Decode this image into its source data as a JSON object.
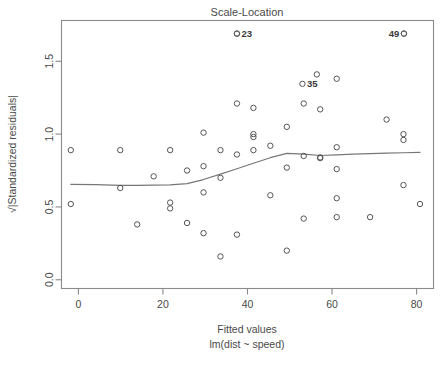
{
  "chart_data": {
    "type": "scatter",
    "title": "Scale-Location",
    "xlabel": "Fitted values",
    "xlabel_sub": "lm(dist ~ speed)",
    "ylabel": "√|Standardized residuals|",
    "xlim": [
      -4,
      84
    ],
    "ylim": [
      -0.06,
      1.78
    ],
    "xticks": [
      0,
      20,
      40,
      60,
      80
    ],
    "xtick_labels": [
      "0",
      "20",
      "40",
      "60",
      "80"
    ],
    "yticks": [
      0.0,
      0.5,
      1.0,
      1.5
    ],
    "ytick_labels": [
      "0.0",
      "0.5",
      "1.0",
      "1.5"
    ],
    "grid": false,
    "legend": null,
    "point_style": "open-circle",
    "points": [
      {
        "x": -1.8,
        "y": 0.89
      },
      {
        "x": -1.8,
        "y": 0.52
      },
      {
        "x": 9.9,
        "y": 0.89
      },
      {
        "x": 9.9,
        "y": 0.63
      },
      {
        "x": 13.9,
        "y": 0.38
      },
      {
        "x": 17.8,
        "y": 0.71
      },
      {
        "x": 21.7,
        "y": 0.89
      },
      {
        "x": 21.7,
        "y": 0.53
      },
      {
        "x": 21.7,
        "y": 0.49
      },
      {
        "x": 25.7,
        "y": 0.75
      },
      {
        "x": 25.7,
        "y": 0.39
      },
      {
        "x": 29.6,
        "y": 1.01
      },
      {
        "x": 29.6,
        "y": 0.78
      },
      {
        "x": 29.6,
        "y": 0.6
      },
      {
        "x": 29.6,
        "y": 0.32
      },
      {
        "x": 33.6,
        "y": 0.89
      },
      {
        "x": 33.6,
        "y": 0.7
      },
      {
        "x": 33.6,
        "y": 0.16
      },
      {
        "x": 37.5,
        "y": 1.21
      },
      {
        "x": 37.5,
        "y": 0.86
      },
      {
        "x": 37.5,
        "y": 0.31
      },
      {
        "x": 37.5,
        "y": 1.69
      },
      {
        "x": 41.4,
        "y": 1.18
      },
      {
        "x": 41.4,
        "y": 1.0
      },
      {
        "x": 41.4,
        "y": 0.89
      },
      {
        "x": 41.4,
        "y": 0.98
      },
      {
        "x": 45.4,
        "y": 0.92
      },
      {
        "x": 45.4,
        "y": 0.58
      },
      {
        "x": 49.3,
        "y": 1.05
      },
      {
        "x": 49.3,
        "y": 0.77
      },
      {
        "x": 49.3,
        "y": 0.2
      },
      {
        "x": 53.3,
        "y": 1.21
      },
      {
        "x": 53.3,
        "y": 0.85
      },
      {
        "x": 53.3,
        "y": 0.42
      },
      {
        "x": 56.4,
        "y": 1.41
      },
      {
        "x": 57.2,
        "y": 1.17
      },
      {
        "x": 57.2,
        "y": 0.84
      },
      {
        "x": 57.2,
        "y": 0.835
      },
      {
        "x": 61.1,
        "y": 1.38
      },
      {
        "x": 61.1,
        "y": 0.91
      },
      {
        "x": 61.1,
        "y": 0.76
      },
      {
        "x": 61.1,
        "y": 0.56
      },
      {
        "x": 61.1,
        "y": 0.43
      },
      {
        "x": 69.0,
        "y": 0.43
      },
      {
        "x": 72.9,
        "y": 1.1
      },
      {
        "x": 76.9,
        "y": 1.0
      },
      {
        "x": 76.9,
        "y": 0.96
      },
      {
        "x": 76.9,
        "y": 0.65
      },
      {
        "x": 80.8,
        "y": 0.52
      },
      {
        "x": 77.0,
        "y": 1.69
      }
    ],
    "labeled_points": [
      {
        "id": "23",
        "x": 37.5,
        "y": 1.69,
        "label_side": "right"
      },
      {
        "id": "35",
        "x": 53.0,
        "y": 1.345,
        "label_side": "right"
      },
      {
        "id": "49",
        "x": 77.0,
        "y": 1.69,
        "label_side": "left"
      }
    ],
    "smooth_line": {
      "name": "loess smoother",
      "x": [
        -1.8,
        4.0,
        9.9,
        13.9,
        17.8,
        21.7,
        25.7,
        29.6,
        33.6,
        37.5,
        41.4,
        45.4,
        49.3,
        53.3,
        57.2,
        61.1,
        65.0,
        69.0,
        72.9,
        76.9,
        80.8
      ],
      "y": [
        0.655,
        0.653,
        0.648,
        0.648,
        0.65,
        0.652,
        0.66,
        0.688,
        0.725,
        0.762,
        0.8,
        0.838,
        0.868,
        0.862,
        0.853,
        0.858,
        0.862,
        0.866,
        0.869,
        0.872,
        0.874
      ]
    }
  }
}
